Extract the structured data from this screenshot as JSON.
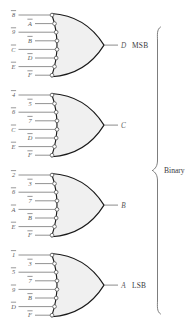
{
  "diagram": {
    "group_label": "Binary",
    "gate_type": "or-gate-inverted-inputs",
    "gates": [
      {
        "id": "gate-msb",
        "output": "D",
        "significance": "MSB",
        "inputs": [
          {
            "text": "8",
            "overbar": true,
            "column": "left"
          },
          {
            "text": "A",
            "overbar": true,
            "column": "right"
          },
          {
            "text": "9",
            "overbar": true,
            "column": "left"
          },
          {
            "text": "B",
            "overbar": true,
            "column": "right"
          },
          {
            "text": "C",
            "overbar": true,
            "column": "left"
          },
          {
            "text": "D",
            "overbar": true,
            "column": "right"
          },
          {
            "text": "E",
            "overbar": true,
            "column": "left"
          },
          {
            "text": "F",
            "overbar": true,
            "column": "right"
          }
        ]
      },
      {
        "id": "gate-c",
        "output": "C",
        "significance": "",
        "inputs": [
          {
            "text": "4",
            "overbar": true,
            "column": "left"
          },
          {
            "text": "5",
            "overbar": true,
            "column": "right"
          },
          {
            "text": "6",
            "overbar": true,
            "column": "left"
          },
          {
            "text": "7",
            "overbar": true,
            "column": "right"
          },
          {
            "text": "C",
            "overbar": true,
            "column": "left"
          },
          {
            "text": "D",
            "overbar": true,
            "column": "right"
          },
          {
            "text": "E",
            "overbar": true,
            "column": "left"
          },
          {
            "text": "F",
            "overbar": true,
            "column": "right"
          }
        ]
      },
      {
        "id": "gate-b",
        "output": "B",
        "significance": "",
        "inputs": [
          {
            "text": "2",
            "overbar": true,
            "column": "left"
          },
          {
            "text": "3",
            "overbar": true,
            "column": "right"
          },
          {
            "text": "6",
            "overbar": true,
            "column": "left"
          },
          {
            "text": "7",
            "overbar": true,
            "column": "right"
          },
          {
            "text": "A",
            "overbar": true,
            "column": "left"
          },
          {
            "text": "B",
            "overbar": true,
            "column": "right"
          },
          {
            "text": "E",
            "overbar": true,
            "column": "left"
          },
          {
            "text": "F",
            "overbar": true,
            "column": "right"
          }
        ]
      },
      {
        "id": "gate-lsb",
        "output": "A",
        "significance": "LSB",
        "inputs": [
          {
            "text": "1",
            "overbar": true,
            "column": "left"
          },
          {
            "text": "3",
            "overbar": true,
            "column": "right"
          },
          {
            "text": "5",
            "overbar": true,
            "column": "left"
          },
          {
            "text": "7",
            "overbar": true,
            "column": "right"
          },
          {
            "text": "9",
            "overbar": true,
            "column": "left"
          },
          {
            "text": "B",
            "overbar": true,
            "column": "right"
          },
          {
            "text": "D",
            "overbar": true,
            "column": "left"
          },
          {
            "text": "F",
            "overbar": true,
            "column": "right"
          }
        ]
      }
    ],
    "colors": {
      "gate_fill": "#f0f0f0",
      "gate_stroke": "#1a1a1a",
      "wire": "#6e6e6e",
      "label": "#58585a",
      "text": "#3a3a3c",
      "background": "#ffffff"
    }
  }
}
